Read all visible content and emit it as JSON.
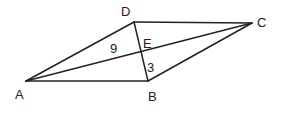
{
  "diagram": {
    "type": "geometry-quadrilateral",
    "points": {
      "A": {
        "label": "A",
        "x": 26,
        "y": 81
      },
      "B": {
        "label": "B",
        "x": 148,
        "y": 81
      },
      "C": {
        "label": "C",
        "x": 252,
        "y": 23
      },
      "D": {
        "label": "D",
        "x": 134,
        "y": 22
      },
      "E": {
        "label": "E",
        "x": 142,
        "y": 52
      }
    },
    "segments": [
      "AB",
      "BC",
      "CD",
      "DA",
      "AC",
      "BD"
    ],
    "measurements": {
      "AE": "9",
      "EB": "3"
    },
    "colors": {
      "stroke": "#222222",
      "background": "#ffffff"
    }
  }
}
